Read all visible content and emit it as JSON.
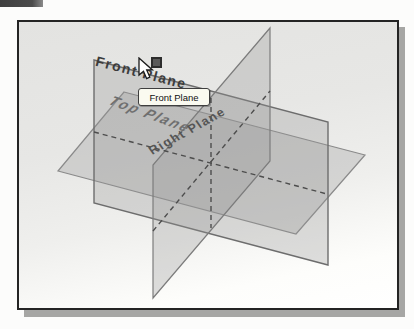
{
  "scene": {
    "labels": {
      "front": "Front Plane",
      "top": "Top Plane",
      "right": "Right Plane"
    },
    "tooltip": {
      "text": "Front Plane"
    },
    "planes": {
      "front_points": "94,60 328,122 328,265 94,203",
      "top_points": "124,92 365,155 296,234 58,171",
      "right_points": "270,28 270,161 153,298 153,165"
    },
    "axes": {
      "x": {
        "x1": "94",
        "y1": "132",
        "x2": "327",
        "y2": "194"
      },
      "y": {
        "x1": "211",
        "y1": "98",
        "x2": "211",
        "y2": "228"
      },
      "z": {
        "x1": "153",
        "y1": "231",
        "x2": "270",
        "y2": "91"
      }
    },
    "colors": {
      "plane_fill": "rgba(148,148,148,0.30)",
      "edge": "#7c7c7c",
      "dashed_axis": "#4d4d4d",
      "frame_border": "#242424",
      "frame_shadow": "#a6a6a4",
      "tooltip_bg": "#fafaf0",
      "handle": "#5a5a5a"
    }
  }
}
